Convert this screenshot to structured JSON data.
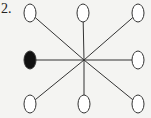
{
  "figure": {
    "label": "2.",
    "center": {
      "x": 84,
      "y": 60
    },
    "line_color": "#333333",
    "node_stroke": "#333333",
    "node_fill_empty": "#ffffff",
    "node_fill_filled": "#111111",
    "nodes": [
      {
        "id": "top-left",
        "x": 30,
        "y": 13,
        "filled": false
      },
      {
        "id": "top-middle",
        "x": 83,
        "y": 13,
        "filled": false
      },
      {
        "id": "top-right",
        "x": 138,
        "y": 13,
        "filled": false
      },
      {
        "id": "middle-left",
        "x": 30,
        "y": 60,
        "filled": true
      },
      {
        "id": "middle-right",
        "x": 138,
        "y": 60,
        "filled": false
      },
      {
        "id": "bottom-left",
        "x": 30,
        "y": 104,
        "filled": false
      },
      {
        "id": "bottom-middle",
        "x": 84,
        "y": 104,
        "filled": false
      },
      {
        "id": "bottom-right",
        "x": 138,
        "y": 104,
        "filled": false
      }
    ]
  }
}
